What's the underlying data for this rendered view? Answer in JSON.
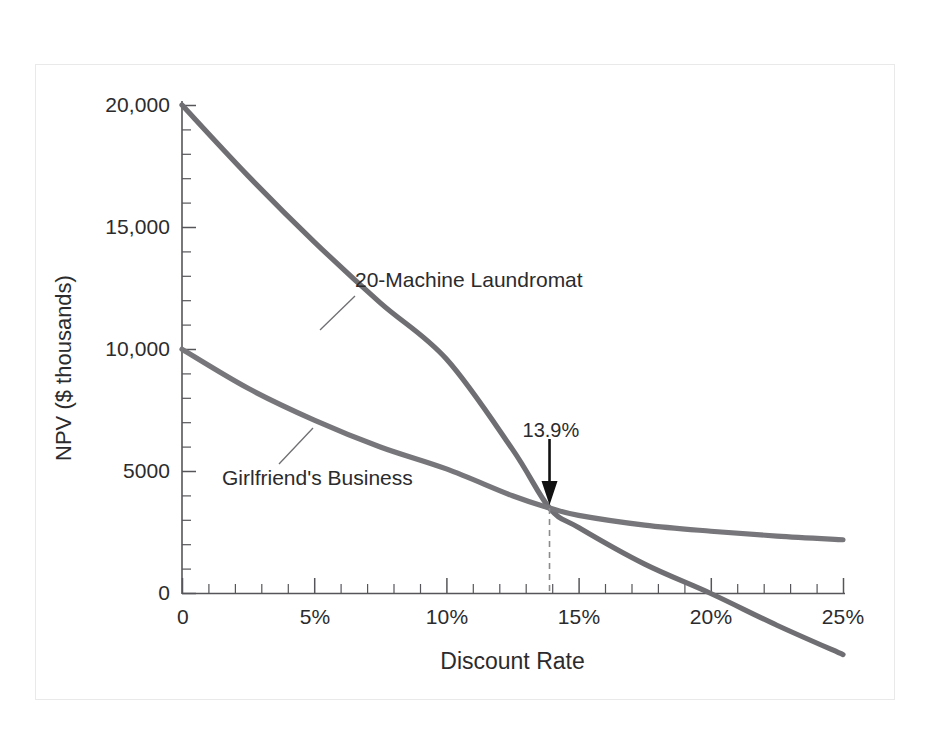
{
  "chart_data": {
    "type": "line",
    "title": "",
    "xlabel": "Discount Rate",
    "ylabel": "NPV ($ thousands)",
    "xlim": [
      0,
      25
    ],
    "ylim": [
      -3000,
      20000
    ],
    "grid": false,
    "legend_position": "inline-annotations",
    "x_tick_labels": [
      "0",
      "5%",
      "10%",
      "15%",
      "20%",
      "25%"
    ],
    "x_tick_values": [
      0,
      5,
      10,
      15,
      20,
      25
    ],
    "x_minor_tick_step": 1,
    "y_tick_labels": [
      "0",
      "5000",
      "10,000",
      "15,000",
      "20,000"
    ],
    "y_tick_values": [
      0,
      5000,
      10000,
      15000,
      20000
    ],
    "y_minor_tick_step": 1000,
    "series": [
      {
        "name": "20-Machine Laundromat",
        "color": "#6f6f73",
        "x": [
          0,
          2.5,
          5,
          7.5,
          10,
          12.5,
          13.9,
          15,
          17.5,
          20,
          22.5,
          25
        ],
        "values": [
          20000,
          17100,
          14400,
          11900,
          9600,
          5900,
          3500,
          2700,
          1200,
          0,
          -1300,
          -2500
        ]
      },
      {
        "name": "Girlfriend's Business",
        "color": "#77777b",
        "x": [
          0,
          2.5,
          5,
          7.5,
          10,
          12.5,
          13.9,
          15,
          17.5,
          20,
          22.5,
          25
        ],
        "values": [
          10000,
          8400,
          7100,
          6000,
          5100,
          4000,
          3500,
          3200,
          2800,
          2550,
          2350,
          2200
        ]
      }
    ],
    "annotations": [
      {
        "name": "crossover",
        "label": "13.9%",
        "x": 13.9,
        "y": 3500,
        "marker": "down-arrow-with-dashed-dropline"
      },
      {
        "name": "series-label-laundromat",
        "label": "20-Machine Laundromat",
        "points_to_x": 9.2,
        "points_to_y": 10300
      },
      {
        "name": "series-label-girlfriend",
        "label": "Girlfriend's Business",
        "points_to_x": 5.1,
        "points_to_y": 7050
      }
    ]
  },
  "axes": {
    "y_title": "NPV ($ thousands)",
    "x_title": "Discount Rate",
    "y_ticks": [
      {
        "label": "20,000",
        "value": 20000
      },
      {
        "label": "15,000",
        "value": 15000
      },
      {
        "label": "10,000",
        "value": 10000
      },
      {
        "label": "5000",
        "value": 5000
      },
      {
        "label": "0",
        "value": 0
      }
    ],
    "x_ticks": [
      {
        "label": "0",
        "value": 0
      },
      {
        "label": "5%",
        "value": 5
      },
      {
        "label": "10%",
        "value": 10
      },
      {
        "label": "15%",
        "value": 15
      },
      {
        "label": "20%",
        "value": 20
      },
      {
        "label": "25%",
        "value": 25
      }
    ]
  },
  "annotations": {
    "laundromat_label": "20-Machine Laundromat",
    "girlfriend_label": "Girlfriend's Business",
    "crossover_label": "13.9%"
  },
  "margin_text": "",
  "colors": {
    "line_laundromat": "#6f6f73",
    "line_girlfriend": "#77777b",
    "axis": "#56565a",
    "arrow": "#111111",
    "dropline": "#8b8b8f",
    "frame": "#e9e9ea",
    "text": "#2b2b2d",
    "background": "#ffffff"
  }
}
